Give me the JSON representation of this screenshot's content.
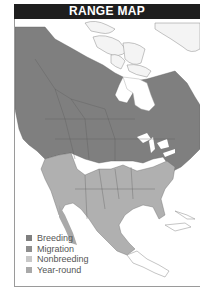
{
  "header": {
    "title": "RANGE MAP"
  },
  "colors": {
    "breeding": "#7f7f7f",
    "migration": "#8e8e8e",
    "nonbreeding": "#c4c4c4",
    "year_round": "#a9a9a9",
    "water": "#ffffff",
    "border": "#555555"
  },
  "legend": {
    "items": [
      {
        "label": "Breeding",
        "color": "#7f7f7f"
      },
      {
        "label": "Migration",
        "color": "#8e8e8e"
      },
      {
        "label": "Nonbreeding",
        "color": "#c8c8c8"
      },
      {
        "label": "Year-round",
        "color": "#a9a9a9"
      }
    ]
  }
}
